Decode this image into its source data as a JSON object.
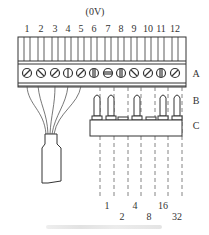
{
  "diagram": {
    "voltage_label": "(0V)",
    "terminal_numbers": [
      "1",
      "2",
      "3",
      "4",
      "5",
      "6",
      "7",
      "8",
      "9",
      "10",
      "11",
      "12"
    ],
    "row_labels": {
      "A": "A",
      "B": "B",
      "C": "C"
    },
    "bit_weights_row1": [
      "1",
      "4",
      "16"
    ],
    "bit_weights_row2": [
      "2",
      "8",
      "32"
    ],
    "components": [
      "terminal-block",
      "screw-terminals",
      "jumper-pins",
      "jumper-base",
      "cable-plug",
      "dashed-signal-lines"
    ],
    "colors": {
      "line": "#333333",
      "background": "#ffffff",
      "caption": "#e0e0e0"
    }
  }
}
